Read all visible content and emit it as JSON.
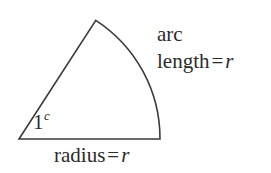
{
  "figure": {
    "background_color": "#ffffff",
    "stroke_color": "#3a3a3a",
    "text_color": "#2b2b2b",
    "stroke_width": 1.6
  },
  "geometry": {
    "type": "circular-sector",
    "center": {
      "x": 19,
      "y": 139
    },
    "radius": 141,
    "angle_radians": 1,
    "angle_degrees": 57.3,
    "base_end": {
      "x": 160,
      "y": 139
    },
    "apex": {
      "x": 95,
      "y": 22
    },
    "arc_mid": {
      "x": 147,
      "y": 80
    }
  },
  "labels": {
    "angle": {
      "value": "1",
      "superscript": "c",
      "meaning": "one radian"
    },
    "arc": {
      "line1": "arc",
      "word": "length",
      "equals": "=",
      "variable": "r"
    },
    "radius": {
      "word": "radius",
      "equals": "=",
      "variable": "r"
    }
  }
}
